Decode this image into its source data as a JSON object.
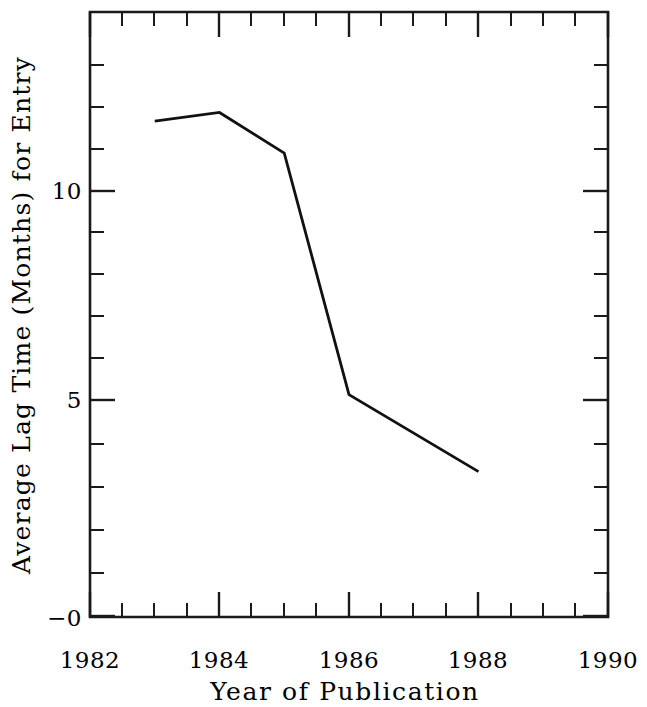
{
  "chart_data": {
    "type": "line",
    "title": "",
    "xlabel": "Year of Publication",
    "ylabel": "Average Lag Time (Months) for Entry",
    "x": [
      1983,
      1984,
      1985,
      1986,
      1988
    ],
    "values": [
      11.6,
      11.8,
      10.85,
      5.2,
      3.4
    ],
    "series": [
      {
        "name": "Average lag time",
        "x": [
          1983,
          1984,
          1985,
          1986,
          1988
        ],
        "values": [
          11.6,
          11.8,
          10.85,
          5.2,
          3.4
        ]
      }
    ],
    "xlim": [
      1982,
      1990
    ],
    "ylim": [
      0,
      14.15
    ],
    "xticks": [
      1982,
      1984,
      1986,
      1988,
      1990
    ],
    "xticklabels": [
      "1982",
      "1984",
      "1986",
      "1988",
      "1990"
    ],
    "x_minor_step": 0.5,
    "yticks": [
      0,
      5,
      10
    ],
    "yticklabels": [
      "−0",
      "5",
      "10"
    ],
    "y_minor_step": 1,
    "grid": false,
    "legend": false,
    "legend_position": "none",
    "line_color": "#111111",
    "frame_color": "#1a1a1a",
    "background": "#ffffff",
    "annotations": []
  },
  "axes": {
    "x_tick_labels": [
      {
        "value": 1982,
        "text": "1982"
      },
      {
        "value": 1984,
        "text": "1984"
      },
      {
        "value": 1986,
        "text": "1986"
      },
      {
        "value": 1988,
        "text": "1988"
      },
      {
        "value": 1990,
        "text": "1990"
      }
    ],
    "y_tick_labels": [
      {
        "value": 0,
        "text": "−0"
      },
      {
        "value": 5,
        "text": "5"
      },
      {
        "value": 10,
        "text": "10"
      }
    ],
    "x_title": "Year of Publication",
    "y_title": "Average Lag Time (Months) for Entry"
  }
}
